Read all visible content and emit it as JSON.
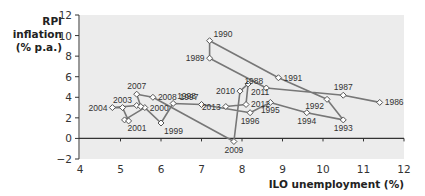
{
  "chart_data": {
    "type": "scatter",
    "subtype": "connected-scatter",
    "title": "",
    "xlabel": "ILO unemployment (%)",
    "ylabel": "RPI inflation (% p.a.)",
    "ylabel_lines": [
      "RPI",
      "inflation",
      "(% p.a.)"
    ],
    "xlim": [
      4,
      12
    ],
    "ylim": [
      -2,
      12
    ],
    "x_ticks": [
      4,
      5,
      6,
      7,
      8,
      9,
      10,
      11,
      12
    ],
    "y_ticks": [
      -2,
      0,
      2,
      4,
      6,
      8,
      10,
      12
    ],
    "grid": false,
    "legend": null,
    "colors": {
      "plot_bg": "#ececec",
      "line": "#777777",
      "marker_fill": "#ffffff",
      "marker_stroke": "#555555",
      "axis": "#333333"
    },
    "points": [
      {
        "year": "1986",
        "x": 11.4,
        "y": 3.5,
        "label_pos": "right"
      },
      {
        "year": "1987",
        "x": 10.5,
        "y": 4.2,
        "label_pos": "top"
      },
      {
        "year": "1988",
        "x": 8.6,
        "y": 4.9,
        "label_pos": "topleft"
      },
      {
        "year": "1989",
        "x": 7.2,
        "y": 7.8,
        "label_pos": "left"
      },
      {
        "year": "1990",
        "x": 7.2,
        "y": 9.5,
        "label_pos": "topright"
      },
      {
        "year": "1991",
        "x": 8.9,
        "y": 5.9,
        "label_pos": "right"
      },
      {
        "year": "1992",
        "x": 10.1,
        "y": 3.8,
        "label_pos": "bottomleft"
      },
      {
        "year": "1993",
        "x": 10.5,
        "y": 1.8,
        "label_pos": "bottom"
      },
      {
        "year": "1994",
        "x": 9.6,
        "y": 2.5,
        "label_pos": "bottom"
      },
      {
        "year": "1995",
        "x": 8.7,
        "y": 3.5,
        "label_pos": "bottom"
      },
      {
        "year": "1996",
        "x": 8.2,
        "y": 2.5,
        "label_pos": "bottom"
      },
      {
        "year": "1997",
        "x": 7.0,
        "y": 3.3,
        "label_pos": "topleft"
      },
      {
        "year": "1998",
        "x": 6.3,
        "y": 3.4,
        "label_pos": "topright"
      },
      {
        "year": "1999",
        "x": 6.0,
        "y": 1.5,
        "label_pos": "bottomright"
      },
      {
        "year": "2000",
        "x": 5.6,
        "y": 3.0,
        "label_pos": "right"
      },
      {
        "year": "2001",
        "x": 5.1,
        "y": 1.8,
        "label_pos": "bottomright"
      },
      {
        "year": "2002",
        "x": 5.2,
        "y": 1.7,
        "label_pos": "none"
      },
      {
        "year": "2003",
        "x": 5.05,
        "y": 3.0,
        "label_pos": "top"
      },
      {
        "year": "2004",
        "x": 4.8,
        "y": 3.0,
        "label_pos": "left"
      },
      {
        "year": "2005",
        "x": 5.4,
        "y": 3.2,
        "label_pos": "none"
      },
      {
        "year": "2006",
        "x": 5.5,
        "y": 3.1,
        "label_pos": "none"
      },
      {
        "year": "2007",
        "x": 5.4,
        "y": 4.3,
        "label_pos": "top"
      },
      {
        "year": "2008",
        "x": 5.8,
        "y": 4.0,
        "label_pos": "right"
      },
      {
        "year": "2009",
        "x": 7.8,
        "y": -0.3,
        "label_pos": "bottom"
      },
      {
        "year": "2010",
        "x": 7.95,
        "y": 4.6,
        "label_pos": "left"
      },
      {
        "year": "2011",
        "x": 8.15,
        "y": 5.3,
        "label_pos": "bottomright"
      },
      {
        "year": "2012",
        "x": 8.1,
        "y": 3.3,
        "label_pos": "right"
      },
      {
        "year": "2013",
        "x": 7.6,
        "y": 3.1,
        "label_pos": "left"
      }
    ]
  }
}
